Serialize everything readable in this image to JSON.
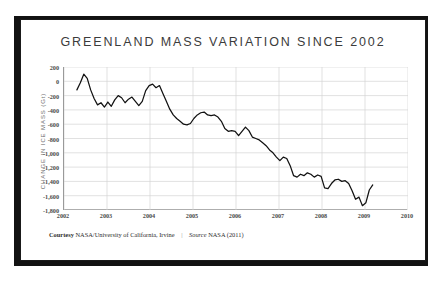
{
  "card": {
    "title": "GREENLAND MASS VARIATION SINCE 2002"
  },
  "credit": {
    "courtesy_label": "Courtesy",
    "courtesy_value": "NASA/University of California, Irvine",
    "separator": "|",
    "source_label": "Source",
    "source_value": "NASA (2011)"
  },
  "chart_data": {
    "type": "line",
    "title": "GREENLAND MASS VARIATION SINCE 2002",
    "xlabel": "",
    "ylabel": "CHANGE IN ICE MASS (Gt)",
    "xlim": [
      2002,
      2010
    ],
    "ylim": [
      -1800,
      200
    ],
    "grid": true,
    "legend": false,
    "line_color": "#111111",
    "grid_color": "#d4d4d4",
    "axis_color": "#9a9a9a",
    "ytick_labels": [
      "200",
      "0",
      "-200",
      "-400",
      "-600",
      "-800",
      "-1,000",
      "-1,200",
      "-1,400",
      "-1,600",
      "-1,800"
    ],
    "ytick_values": [
      200,
      0,
      -200,
      -400,
      -600,
      -800,
      -1000,
      -1200,
      -1400,
      -1600,
      -1800
    ],
    "xtick_labels": [
      "2002",
      "2003",
      "2004",
      "2005",
      "2006",
      "2007",
      "2008",
      "2009",
      "2010"
    ],
    "xtick_values": [
      2002,
      2003,
      2004,
      2005,
      2006,
      2007,
      2008,
      2009,
      2010
    ],
    "series": [
      {
        "name": "Greenland ice mass anomaly",
        "x": [
          2002.3,
          2002.38,
          2002.46,
          2002.54,
          2002.62,
          2002.7,
          2002.78,
          2002.86,
          2002.94,
          2003.02,
          2003.1,
          2003.18,
          2003.26,
          2003.34,
          2003.42,
          2003.5,
          2003.58,
          2003.66,
          2003.74,
          2003.82,
          2003.9,
          2003.98,
          2004.06,
          2004.14,
          2004.22,
          2004.3,
          2004.38,
          2004.46,
          2004.54,
          2004.62,
          2004.7,
          2004.78,
          2004.86,
          2004.94,
          2005.02,
          2005.1,
          2005.18,
          2005.26,
          2005.34,
          2005.42,
          2005.5,
          2005.58,
          2005.66,
          2005.74,
          2005.82,
          2005.9,
          2005.98,
          2006.06,
          2006.14,
          2006.22,
          2006.3,
          2006.38,
          2006.46,
          2006.54,
          2006.62,
          2006.7,
          2006.78,
          2006.86,
          2006.94,
          2007.02,
          2007.1,
          2007.18,
          2007.26,
          2007.34,
          2007.42,
          2007.5,
          2007.58,
          2007.66,
          2007.74,
          2007.82,
          2007.9,
          2007.98,
          2008.06,
          2008.14,
          2008.22,
          2008.3,
          2008.38,
          2008.46,
          2008.54,
          2008.62,
          2008.7,
          2008.78,
          2008.86,
          2008.94,
          2009.02,
          2009.1,
          2009.18
        ],
        "y": [
          -120,
          -20,
          100,
          40,
          -120,
          -240,
          -330,
          -300,
          -360,
          -290,
          -350,
          -260,
          -200,
          -230,
          -300,
          -250,
          -220,
          -280,
          -340,
          -280,
          -130,
          -60,
          -40,
          -90,
          -60,
          -170,
          -280,
          -390,
          -470,
          -520,
          -560,
          -600,
          -610,
          -590,
          -520,
          -470,
          -440,
          -430,
          -470,
          -480,
          -470,
          -500,
          -560,
          -660,
          -700,
          -690,
          -700,
          -760,
          -700,
          -640,
          -690,
          -780,
          -800,
          -820,
          -860,
          -900,
          -960,
          -1000,
          -1060,
          -1110,
          -1060,
          -1080,
          -1180,
          -1320,
          -1340,
          -1300,
          -1320,
          -1280,
          -1300,
          -1340,
          -1310,
          -1330,
          -1490,
          -1500,
          -1430,
          -1380,
          -1370,
          -1400,
          -1390,
          -1430,
          -1530,
          -1650,
          -1620,
          -1740,
          -1700,
          -1520,
          -1450
        ]
      }
    ]
  }
}
